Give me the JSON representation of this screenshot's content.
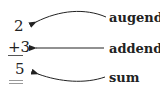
{
  "problem": {
    "augend": "2",
    "addend": "+3",
    "sum": "5"
  },
  "labels": {
    "augend": "augend",
    "addend": "addend",
    "sum": "sum"
  },
  "colors": {
    "text": "#222222",
    "arrow": "#222222",
    "sum_underline": "#999999"
  }
}
